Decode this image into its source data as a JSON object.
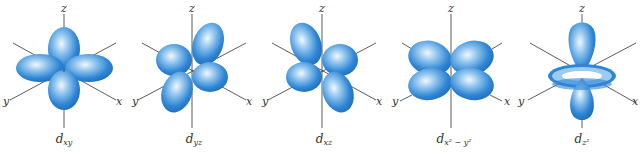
{
  "figure": {
    "lobe_color": "#2a7fcf",
    "lobe_highlight": "#e8f3fc",
    "axis_color": "#333333",
    "orbitals": [
      {
        "name": "dxy",
        "label_main": "d",
        "label_sub": "xy",
        "axes": {
          "z": "z",
          "x": "x",
          "y": "y"
        }
      },
      {
        "name": "dyz",
        "label_main": "d",
        "label_sub": "yz",
        "axes": {
          "z": "z",
          "x": "x",
          "y": "y"
        }
      },
      {
        "name": "dxz",
        "label_main": "d",
        "label_sub": "xz",
        "axes": {
          "z": "z",
          "x": "x",
          "y": "y"
        }
      },
      {
        "name": "dx2-y2",
        "label_main": "d",
        "label_sub": "x² − y²",
        "axes": {
          "z": "z",
          "x": "x",
          "y": "y"
        }
      },
      {
        "name": "dz2",
        "label_main": "d",
        "label_sub": "z²",
        "axes": {
          "z": "z",
          "x": "x",
          "y": "y"
        }
      }
    ]
  }
}
